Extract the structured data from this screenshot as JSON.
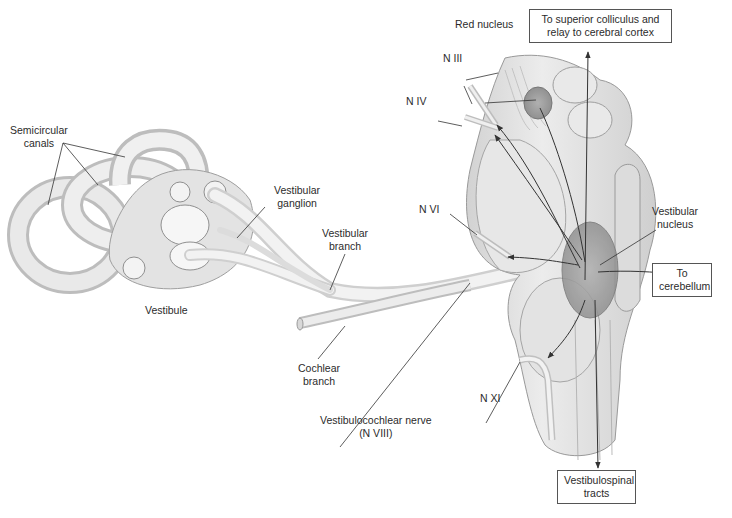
{
  "figure": {
    "structures": {
      "inner_ear": {
        "semicircular_canals": [
          "Semicircular",
          "canals"
        ],
        "vestibule": "Vestibule",
        "vestibular_ganglion": [
          "Vestibular",
          "ganglion"
        ],
        "vestibular_branch": [
          "Vestibular",
          "branch"
        ],
        "cochlear_branch": [
          "Cochlear",
          "branch"
        ],
        "vestibulocochlear_nerve": [
          "Vestibulocochlear nerve",
          "(N  VIII)"
        ]
      },
      "brainstem": {
        "red_nucleus": "Red nucleus",
        "n_iii": "N  III",
        "n_iv": "N  IV",
        "n_vi": "N  VI",
        "n_xi": "N  XI",
        "vestibular_nucleus": [
          "Vestibular",
          "nucleus"
        ]
      }
    },
    "destination_boxes": {
      "superior_colliculus": [
        "To superior colliculus and",
        "relay to cerebral cortex"
      ],
      "cerebellum": [
        "To",
        "cerebellum"
      ],
      "vestibulospinal": [
        "Vestibulospinal",
        "tracts"
      ]
    },
    "colors": {
      "background": "#ffffff",
      "tissue_light": "#e6e6e6",
      "tissue_mid": "#c9c9c9",
      "nucleus_shade": "#9a9a9a",
      "line": "#333333",
      "box_border": "#555555"
    }
  }
}
